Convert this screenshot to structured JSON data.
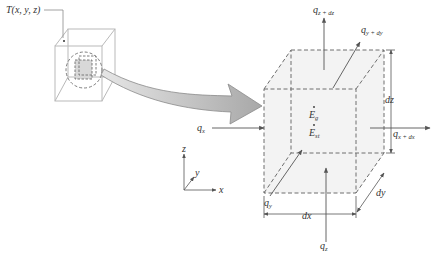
{
  "figure": {
    "type": "differential control volume diagram",
    "point_label": "T(x, y, z)",
    "colors": {
      "line": "#8a8a8a",
      "dash": "#6e6e6e",
      "fill_face": "#f1f1f1",
      "arrow_fill": "#bdbdbd",
      "text": "#333333",
      "small_cube": "#b9b9b9"
    }
  },
  "heat_flows": {
    "qx": {
      "base": "q",
      "sub": "x"
    },
    "qx_dx": {
      "base": "q",
      "sub": "x + dx"
    },
    "qy": {
      "base": "q",
      "sub": "y"
    },
    "qy_dy": {
      "base": "q",
      "sub": "y + dy"
    },
    "qz": {
      "base": "q",
      "sub": "z"
    },
    "qz_dz": {
      "base": "q",
      "sub": "z + dz"
    }
  },
  "energy_terms": {
    "generated": {
      "base": "E",
      "sub": "g"
    },
    "stored": {
      "base": "E",
      "sub": "st"
    }
  },
  "dimensions": {
    "dx": "dx",
    "dy": "dy",
    "dz": "dz"
  },
  "axes": {
    "x": "x",
    "y": "y",
    "z": "z"
  }
}
